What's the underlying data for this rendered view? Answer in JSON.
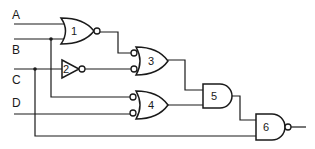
{
  "diagram": {
    "type": "logic-circuit",
    "inputs": [
      {
        "label": "A"
      },
      {
        "label": "B"
      },
      {
        "label": "C"
      },
      {
        "label": "D"
      }
    ],
    "gates": [
      {
        "id": "1",
        "kind": "NOR",
        "inputs": [
          "A",
          "B"
        ]
      },
      {
        "id": "2",
        "kind": "NOT",
        "inputs": [
          "C"
        ]
      },
      {
        "id": "3",
        "kind": "OR with inverted inputs",
        "inputs": [
          "gate1",
          "gate2"
        ]
      },
      {
        "id": "4",
        "kind": "OR with inverted inputs",
        "inputs": [
          "B",
          "D"
        ]
      },
      {
        "id": "5",
        "kind": "AND",
        "inputs": [
          "gate3",
          "gate4"
        ]
      },
      {
        "id": "6",
        "kind": "NAND",
        "inputs": [
          "gate5",
          "C"
        ]
      }
    ],
    "colors": {
      "line": "#1a1a1a",
      "background": "#ffffff"
    }
  }
}
